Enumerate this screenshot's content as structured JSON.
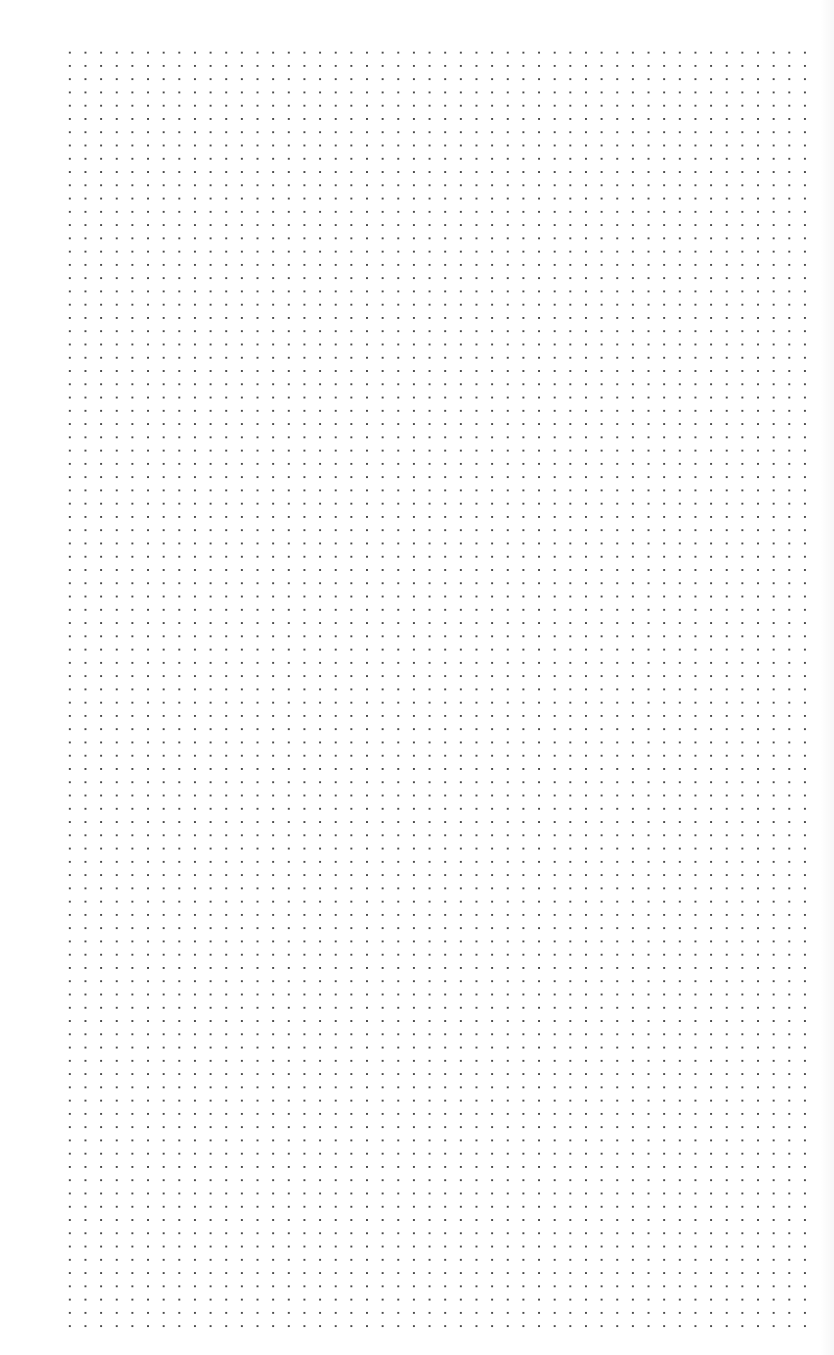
{
  "page": {
    "type": "dot-grid-paper",
    "background_color": "#ffffff",
    "dot_color": "#4a4a4a",
    "grid": {
      "columns": 48,
      "rows": 97,
      "dot_spacing_x_px": 15.65,
      "dot_spacing_y_px": 13.28,
      "left_px": 70,
      "top_px": 53,
      "right_px": 805,
      "bottom_px": 1325
    }
  }
}
